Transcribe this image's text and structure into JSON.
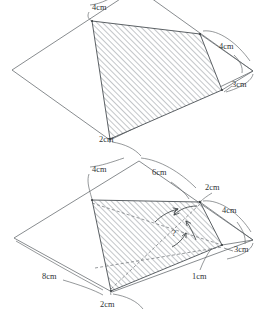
{
  "document": {
    "type": "geometry-figure",
    "title": "Quadrilateral folded-flap diagram pair",
    "background_color": "#ffffff",
    "line_color": "#555a5e",
    "hatch_color": "#9aa0a4",
    "text_color": "#2e3234"
  },
  "figures": [
    {
      "id": "top-figure",
      "name": "Top diagram: outer quadrilateral with shaded inner quadrilateral",
      "labels": [
        {
          "id": "top-4cm-left",
          "text": "4cm",
          "x": 92,
          "y": 10
        },
        {
          "id": "top-4cm-right",
          "text": "4cm",
          "x": 219,
          "y": 49
        },
        {
          "id": "top-3cm",
          "text": "3cm",
          "x": 232,
          "y": 87
        },
        {
          "id": "top-2cm",
          "text": "2cm",
          "x": 99,
          "y": 142
        }
      ]
    },
    {
      "id": "bottom-figure",
      "name": "Bottom diagram: same shape with dashed diagonals, 8cm side and unknown angle",
      "labels": [
        {
          "id": "bot-4cm-left",
          "text": "4cm",
          "x": 92,
          "y": 172
        },
        {
          "id": "bot-6cm",
          "text": "6cm",
          "x": 152,
          "y": 175
        },
        {
          "id": "bot-2cm-top",
          "text": "2cm",
          "x": 205,
          "y": 190
        },
        {
          "id": "bot-4cm-right",
          "text": "4cm",
          "x": 222,
          "y": 213
        },
        {
          "id": "bot-3cm",
          "text": "3cm",
          "x": 234,
          "y": 252
        },
        {
          "id": "bot-1cm",
          "text": "1cm",
          "x": 205,
          "y": 277
        },
        {
          "id": "bot-8cm",
          "text": "8cm",
          "x": 48,
          "y": 277
        },
        {
          "id": "bot-2cm-bottom",
          "text": "2cm",
          "x": 100,
          "y": 307
        },
        {
          "id": "bot-question",
          "text": "?",
          "x": 174,
          "y": 235
        }
      ]
    }
  ],
  "measurements": {
    "top": [
      "4cm",
      "4cm",
      "3cm",
      "2cm"
    ],
    "bottom": [
      "4cm",
      "6cm",
      "2cm",
      "4cm",
      "3cm",
      "1cm",
      "8cm",
      "2cm"
    ],
    "unknown": "?"
  }
}
